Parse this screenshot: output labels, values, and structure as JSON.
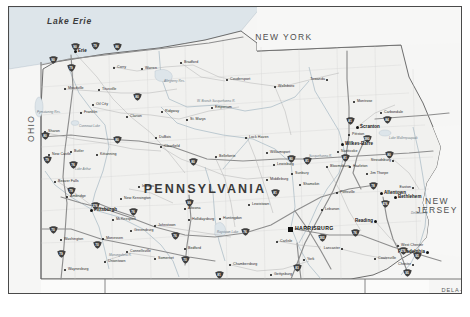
{
  "map": {
    "title": "Pennsylvania State Reference Map",
    "subject_state": "PENNSYLVANIA",
    "capital": "HARRISBURG",
    "background_color": "#ffffff",
    "frame_color": "#4a4a4a",
    "land_color": "#f2f2f0",
    "water_color": "#dfe6ea",
    "road_color": "#9a9a9a",
    "shield_color": "#3f3f3f"
  },
  "water_features": [
    {
      "name": "Lake Erie",
      "x": 38,
      "y": 10
    }
  ],
  "neighbor_states": [
    {
      "name": "NEW YORK",
      "x": 275,
      "y": 26,
      "size": "large"
    },
    {
      "name": "OHIO",
      "x": 18,
      "y": 135,
      "size": "large",
      "rotated": true
    },
    {
      "name": "NEW JERSEY",
      "x": 428,
      "y": 190,
      "size": "large"
    },
    {
      "name": "WEST VIRGINIA",
      "x": 36,
      "y": 288,
      "size": "large"
    },
    {
      "name": "MARYLAND",
      "x": 258,
      "y": 290,
      "size": "large"
    },
    {
      "name": "DELA- WARE",
      "x": 443,
      "y": 281,
      "size": "small"
    },
    {
      "name": "VIRGINIA",
      "x": 192,
      "y": 312,
      "size": "small"
    }
  ],
  "cities": [
    {
      "name": "Erie",
      "x": 66,
      "y": 44,
      "rank": "major"
    },
    {
      "name": "Corry",
      "x": 105,
      "y": 61,
      "rank": "minor"
    },
    {
      "name": "Warren",
      "x": 133,
      "y": 62,
      "rank": "minor"
    },
    {
      "name": "Bradford",
      "x": 172,
      "y": 56,
      "rank": "minor"
    },
    {
      "name": "Coudersport",
      "x": 218,
      "y": 73,
      "rank": "minor"
    },
    {
      "name": "Wellsboro",
      "x": 266,
      "y": 80,
      "rank": "minor"
    },
    {
      "name": "Towanda",
      "x": 318,
      "y": 73,
      "rank": "minor"
    },
    {
      "name": "Meadville",
      "x": 56,
      "y": 82,
      "rank": "minor"
    },
    {
      "name": "Titusville",
      "x": 90,
      "y": 83,
      "rank": "minor"
    },
    {
      "name": "Oil City",
      "x": 84,
      "y": 98,
      "rank": "minor"
    },
    {
      "name": "Franklin",
      "x": 72,
      "y": 106,
      "rank": "minor"
    },
    {
      "name": "Clarion",
      "x": 118,
      "y": 110,
      "rank": "minor"
    },
    {
      "name": "Ridgway",
      "x": 153,
      "y": 105,
      "rank": "minor"
    },
    {
      "name": "St. Marys",
      "x": 178,
      "y": 113,
      "rank": "minor"
    },
    {
      "name": "Emporium",
      "x": 203,
      "y": 101,
      "rank": "minor"
    },
    {
      "name": "Sharon",
      "x": 36,
      "y": 125,
      "rank": "minor"
    },
    {
      "name": "New Castle",
      "x": 40,
      "y": 148,
      "rank": "minor"
    },
    {
      "name": "Butler",
      "x": 62,
      "y": 145,
      "rank": "minor"
    },
    {
      "name": "Kittanning",
      "x": 88,
      "y": 148,
      "rank": "minor"
    },
    {
      "name": "DuBois",
      "x": 147,
      "y": 131,
      "rank": "minor"
    },
    {
      "name": "Clearfield",
      "x": 152,
      "y": 140,
      "rank": "minor"
    },
    {
      "name": "Lock Haven",
      "x": 237,
      "y": 131,
      "rank": "minor"
    },
    {
      "name": "Bellefonte",
      "x": 207,
      "y": 150,
      "rank": "minor"
    },
    {
      "name": "Williamsport",
      "x": 258,
      "y": 146,
      "rank": "minor"
    },
    {
      "name": "Lewisburg",
      "x": 265,
      "y": 158,
      "rank": "minor"
    },
    {
      "name": "Sunbury",
      "x": 283,
      "y": 167,
      "rank": "minor"
    },
    {
      "name": "Middleburg",
      "x": 258,
      "y": 173,
      "rank": "minor"
    },
    {
      "name": "Shamokin",
      "x": 291,
      "y": 178,
      "rank": "minor"
    },
    {
      "name": "Bloomsburg",
      "x": 318,
      "y": 160,
      "rank": "minor"
    },
    {
      "name": "Scranton",
      "x": 348,
      "y": 120,
      "rank": "major"
    },
    {
      "name": "Carbondale",
      "x": 372,
      "y": 106,
      "rank": "minor"
    },
    {
      "name": "Montrose",
      "x": 345,
      "y": 95,
      "rank": "minor"
    },
    {
      "name": "Pittston",
      "x": 340,
      "y": 128,
      "rank": "minor"
    },
    {
      "name": "Wilkes-Barre",
      "x": 333,
      "y": 137,
      "rank": "major"
    },
    {
      "name": "Nanticoke",
      "x": 329,
      "y": 145,
      "rank": "minor"
    },
    {
      "name": "Hazleton",
      "x": 341,
      "y": 160,
      "rank": "minor"
    },
    {
      "name": "Stroudsburg",
      "x": 384,
      "y": 154,
      "rank": "minor"
    },
    {
      "name": "Pottsville",
      "x": 328,
      "y": 186,
      "rank": "minor"
    },
    {
      "name": "Allentown",
      "x": 372,
      "y": 186,
      "rank": "major"
    },
    {
      "name": "Bethlehem",
      "x": 386,
      "y": 190,
      "rank": "major"
    },
    {
      "name": "Easton",
      "x": 404,
      "y": 181,
      "rank": "minor"
    },
    {
      "name": "Reading",
      "x": 366,
      "y": 214,
      "rank": "major"
    },
    {
      "name": "Lebanon",
      "x": 313,
      "y": 203,
      "rank": "minor"
    },
    {
      "name": "HARRISBURG",
      "x": 281,
      "y": 222,
      "rank": "capital"
    },
    {
      "name": "Carlisle",
      "x": 268,
      "y": 235,
      "rank": "minor"
    },
    {
      "name": "Lancaster",
      "x": 333,
      "y": 242,
      "rank": "minor"
    },
    {
      "name": "York",
      "x": 295,
      "y": 253,
      "rank": "minor"
    },
    {
      "name": "Gettysburg",
      "x": 262,
      "y": 268,
      "rank": "minor"
    },
    {
      "name": "Chambersburg",
      "x": 221,
      "y": 258,
      "rank": "minor"
    },
    {
      "name": "Coatesville",
      "x": 366,
      "y": 252,
      "rank": "minor"
    },
    {
      "name": "West Chester",
      "x": 389,
      "y": 239,
      "rank": "minor"
    },
    {
      "name": "Philadelphia",
      "x": 418,
      "y": 245,
      "rank": "major"
    },
    {
      "name": "Chester",
      "x": 404,
      "y": 258,
      "rank": "minor"
    },
    {
      "name": "Huntingdon",
      "x": 211,
      "y": 212,
      "rank": "minor"
    },
    {
      "name": "Lewistown",
      "x": 240,
      "y": 198,
      "rank": "minor"
    },
    {
      "name": "Altoona",
      "x": 176,
      "y": 202,
      "rank": "minor"
    },
    {
      "name": "Hollidaysburg",
      "x": 180,
      "y": 213,
      "rank": "minor"
    },
    {
      "name": "Johnstown",
      "x": 146,
      "y": 219,
      "rank": "minor"
    },
    {
      "name": "Bedford",
      "x": 176,
      "y": 242,
      "rank": "minor"
    },
    {
      "name": "Somerset",
      "x": 146,
      "y": 252,
      "rank": "minor"
    },
    {
      "name": "Connellsville",
      "x": 118,
      "y": 245,
      "rank": "minor"
    },
    {
      "name": "Uniontown",
      "x": 96,
      "y": 255,
      "rank": "minor"
    },
    {
      "name": "Waynesburg",
      "x": 56,
      "y": 263,
      "rank": "minor"
    },
    {
      "name": "Washington",
      "x": 52,
      "y": 233,
      "rank": "minor"
    },
    {
      "name": "Monessen",
      "x": 94,
      "y": 232,
      "rank": "minor"
    },
    {
      "name": "Greensburg",
      "x": 122,
      "y": 224,
      "rank": "minor"
    },
    {
      "name": "McKeesport",
      "x": 104,
      "y": 213,
      "rank": "minor"
    },
    {
      "name": "Pittsburgh",
      "x": 82,
      "y": 203,
      "rank": "major"
    },
    {
      "name": "New Kensington",
      "x": 112,
      "y": 192,
      "rank": "minor"
    },
    {
      "name": "Indiana",
      "x": 130,
      "y": 180,
      "rank": "minor"
    },
    {
      "name": "Beaver Falls",
      "x": 46,
      "y": 175,
      "rank": "minor"
    },
    {
      "name": "Ambridge",
      "x": 58,
      "y": 190,
      "rank": "minor"
    },
    {
      "name": "Jim Thorpe",
      "x": 358,
      "y": 167,
      "rank": "minor"
    }
  ],
  "water_labels": [
    {
      "name": "W. Branch Susquehanna R.",
      "x": 188,
      "y": 93
    },
    {
      "name": "Pymatuning Res.",
      "x": 28,
      "y": 104
    },
    {
      "name": "Conneaut Lake",
      "x": 70,
      "y": 118
    },
    {
      "name": "Allegheny Res.",
      "x": 155,
      "y": 73
    },
    {
      "name": "Raystown Lake",
      "x": 208,
      "y": 224
    },
    {
      "name": "Lake Wallenpaupack",
      "x": 380,
      "y": 130
    },
    {
      "name": "Susquehanna R.",
      "x": 300,
      "y": 148
    },
    {
      "name": "Lake Arthur",
      "x": 66,
      "y": 161
    },
    {
      "name": "Monongahela R.",
      "x": 100,
      "y": 247
    },
    {
      "name": "Delaware R.",
      "x": 402,
      "y": 205
    },
    {
      "name": "Potomac R.",
      "x": 203,
      "y": 303
    }
  ],
  "interstate_shields": [
    {
      "route": "90",
      "x": 66,
      "y": 40
    },
    {
      "route": "79",
      "x": 86,
      "y": 39
    },
    {
      "route": "86",
      "x": 108,
      "y": 40
    },
    {
      "route": "90",
      "x": 44,
      "y": 53
    },
    {
      "route": "79",
      "x": 62,
      "y": 61
    },
    {
      "route": "80",
      "x": 36,
      "y": 129
    },
    {
      "route": "79",
      "x": 38,
      "y": 153
    },
    {
      "route": "76",
      "x": 64,
      "y": 158
    },
    {
      "route": "80",
      "x": 108,
      "y": 133
    },
    {
      "route": "80",
      "x": 184,
      "y": 155
    },
    {
      "route": "80",
      "x": 282,
      "y": 152
    },
    {
      "route": "81",
      "x": 341,
      "y": 114
    },
    {
      "route": "84",
      "x": 378,
      "y": 113
    },
    {
      "route": "81",
      "x": 336,
      "y": 151
    },
    {
      "route": "80",
      "x": 380,
      "y": 148
    },
    {
      "route": "78",
      "x": 364,
      "y": 179
    },
    {
      "route": "476",
      "x": 376,
      "y": 197
    },
    {
      "route": "81",
      "x": 298,
      "y": 154
    },
    {
      "route": "80",
      "x": 128,
      "y": 90
    },
    {
      "route": "79",
      "x": 62,
      "y": 184
    },
    {
      "route": "376",
      "x": 86,
      "y": 199
    },
    {
      "route": "76",
      "x": 124,
      "y": 205
    },
    {
      "route": "70",
      "x": 44,
      "y": 223
    },
    {
      "route": "70",
      "x": 88,
      "y": 238
    },
    {
      "route": "79",
      "x": 52,
      "y": 247
    },
    {
      "route": "76",
      "x": 166,
      "y": 229
    },
    {
      "route": "70",
      "x": 176,
      "y": 253
    },
    {
      "route": "81",
      "x": 210,
      "y": 268
    },
    {
      "route": "83",
      "x": 288,
      "y": 261
    },
    {
      "route": "76",
      "x": 236,
      "y": 225
    },
    {
      "route": "283",
      "x": 313,
      "y": 231
    },
    {
      "route": "76",
      "x": 346,
      "y": 226
    },
    {
      "route": "95",
      "x": 408,
      "y": 249
    },
    {
      "route": "476",
      "x": 394,
      "y": 244
    },
    {
      "route": "95",
      "x": 398,
      "y": 266
    },
    {
      "route": "81",
      "x": 266,
      "y": 186
    },
    {
      "route": "99",
      "x": 180,
      "y": 196
    },
    {
      "route": "380",
      "x": 358,
      "y": 132
    }
  ]
}
